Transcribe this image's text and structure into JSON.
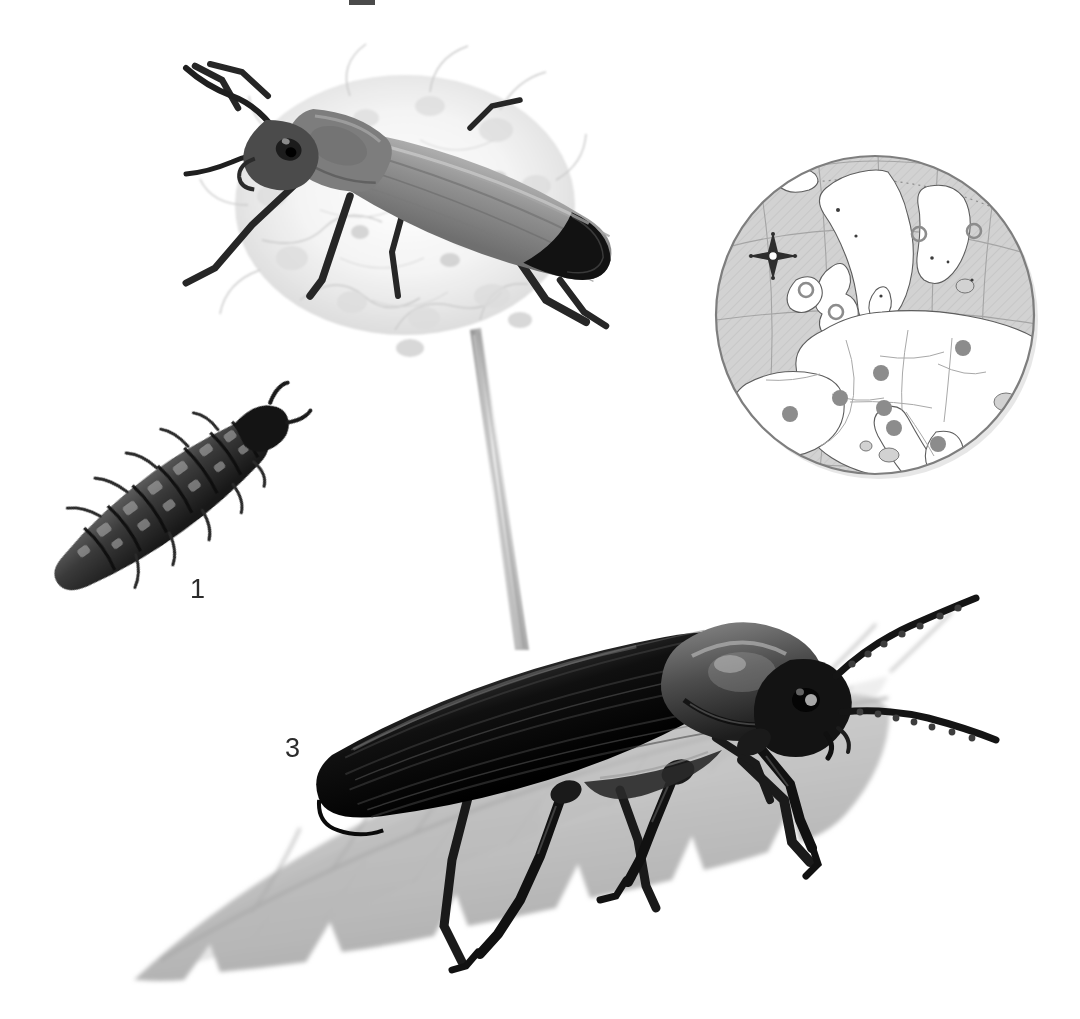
{
  "plate": {
    "kind": "natural-history-illustration-plate",
    "background_color": "#ffffff",
    "width": 1080,
    "height": 1019
  },
  "labels": [
    {
      "id": "1",
      "text": "1",
      "refers_to": "larva",
      "x": 190,
      "y": 576
    },
    {
      "id": "3",
      "text": "3",
      "refers_to": "adult-beetle-dark-on-leaf",
      "x": 285,
      "y": 735
    }
  ],
  "figures": {
    "larva": {
      "name": "beetle-larva",
      "description": "Dark, velvety, segmented campodeiform larva with bristles, oriented diagonally",
      "label": "1",
      "color": "#3a3a3a"
    },
    "adult_pale": {
      "name": "adult-beetle-pale-on-flower",
      "description": "Pale grey soldier beetle with dark head, long antennae and black elytra tips, resting on a white umbel flower head",
      "color": "#8e8e8e",
      "accent_color": "#1c1c1c"
    },
    "flower": {
      "name": "umbel-flower-head",
      "description": "Pale umbelliferous flower head on a long slender stem",
      "color": "#e2e2e2",
      "stem_color": "#9a9a9a"
    },
    "adult_dark": {
      "name": "adult-beetle-dark-on-leaf",
      "description": "Large black soldier beetle with striated elytra, domed pronotum and long beaded antennae, standing on a serrated leaf",
      "label": "3",
      "color": "#111111"
    },
    "leaf": {
      "name": "serrated-leaf",
      "description": "Broad grey toothed leaf with visible venation, drawn in pencil wash",
      "color": "#cdcdcd",
      "vein_color": "#9b9b9b"
    }
  },
  "distribution_map": {
    "name": "europe-distribution-map",
    "shape": "circle",
    "center_x": 875,
    "center_y": 315,
    "radius": 160,
    "sea_color": "#d2d2d2",
    "land_color": "#ffffff",
    "outline_color": "#7e7e7e",
    "graticule_color": "#9a9a9a",
    "compass": {
      "name": "compass-rose",
      "x": 773,
      "y": 256
    },
    "legend": {
      "present_symbol": "filled-dot",
      "present_color": "#8c8c8c",
      "absent_symbol": "hollow-circle",
      "absent_color": "#8c8c8c"
    },
    "present_points": [
      {
        "region": "Germany",
        "x": 881,
        "y": 373,
        "r": 8
      },
      {
        "region": "France",
        "x": 840,
        "y": 398,
        "r": 8
      },
      {
        "region": "Switzerland",
        "x": 884,
        "y": 408,
        "r": 8
      },
      {
        "region": "Spain",
        "x": 790,
        "y": 414,
        "r": 8
      },
      {
        "region": "Italy",
        "x": 894,
        "y": 428,
        "r": 8
      },
      {
        "region": "Belarus/Russia",
        "x": 963,
        "y": 348,
        "r": 8
      },
      {
        "region": "Balkans",
        "x": 938,
        "y": 444,
        "r": 8
      }
    ],
    "absent_points": [
      {
        "region": "Ireland",
        "x": 806,
        "y": 290,
        "r": 7
      },
      {
        "region": "Britain",
        "x": 836,
        "y": 312,
        "r": 7
      },
      {
        "region": "Norway",
        "x": 919,
        "y": 234,
        "r": 7
      },
      {
        "region": "Finland",
        "x": 974,
        "y": 231,
        "r": 7
      }
    ]
  },
  "crop_mark": {
    "name": "printers-crop-mark",
    "x": 349,
    "y": 0,
    "width": 26,
    "height": 5
  }
}
